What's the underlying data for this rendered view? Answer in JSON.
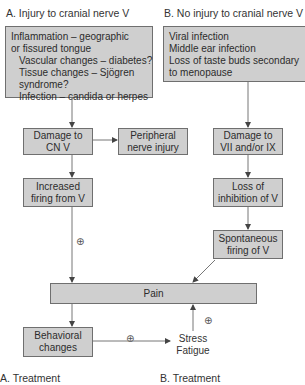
{
  "diagram": {
    "colors": {
      "box_fill": "#cfcfcf",
      "box_border": "#6f6f6f",
      "arrow": "#555555",
      "text": "#2c2c2c"
    },
    "section_a": {
      "title": "A. Injury to cranial nerve V",
      "causes": [
        {
          "text": "Inflammation – geographic",
          "indent": false
        },
        {
          "text": "or fissured tongue",
          "indent": false
        },
        {
          "text": "Vascular changes – diabetes?",
          "indent": true
        },
        {
          "text": "Tissue changes – Sjögren",
          "indent": true
        },
        {
          "text": "syndrome?",
          "indent": true
        },
        {
          "text": "Infection – candida or herpes",
          "indent": true
        }
      ],
      "damage": [
        "Damage to",
        "CN V"
      ],
      "peripheral": [
        "Peripheral",
        "nerve injury"
      ],
      "increased_firing": [
        "Increased",
        "firing from V"
      ]
    },
    "section_b": {
      "title": "B. No injury to cranial nerve V",
      "causes": [
        "Viral infection",
        "Middle ear infection",
        "Loss of taste buds secondary",
        "to menopause"
      ],
      "damage": [
        "Damage to",
        "VII and/or IX"
      ],
      "loss_inhibition": [
        "Loss of",
        "inhibition of V"
      ],
      "spontaneous": [
        "Spontaneous",
        "firing of V"
      ]
    },
    "pain": "Pain",
    "behavioral": [
      "Behavioral",
      "changes"
    ],
    "stress": [
      "Stress",
      "Fatigue"
    ],
    "positive_symbol": "⊕",
    "footer": {
      "a_treatment": "A.  Treatment",
      "b_treatment": "B.  Treatment"
    }
  }
}
